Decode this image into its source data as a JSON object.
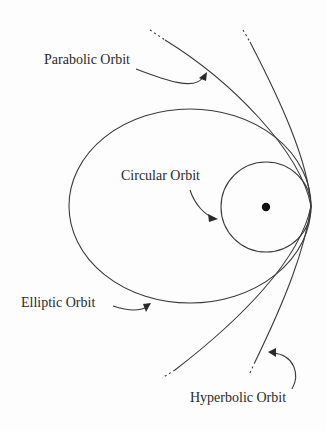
{
  "diagram": {
    "labels": {
      "parabolic": "Parabolic Orbit",
      "circular": "Circular Orbit",
      "elliptic": "Elliptic Orbit",
      "hyperbolic": "Hyperbolic Orbit"
    },
    "colors": {
      "stroke": "#3a3a3a",
      "text": "#2a2a2a",
      "focus": "#111111",
      "background": "#fdfdfd"
    },
    "focus": {
      "cx": 266,
      "cy": 207,
      "r": 4
    },
    "circle": {
      "cx": 266,
      "cy": 207,
      "r": 45
    },
    "ellipse": {
      "cx": 190,
      "cy": 206,
      "rx": 121,
      "ry": 97
    }
  }
}
